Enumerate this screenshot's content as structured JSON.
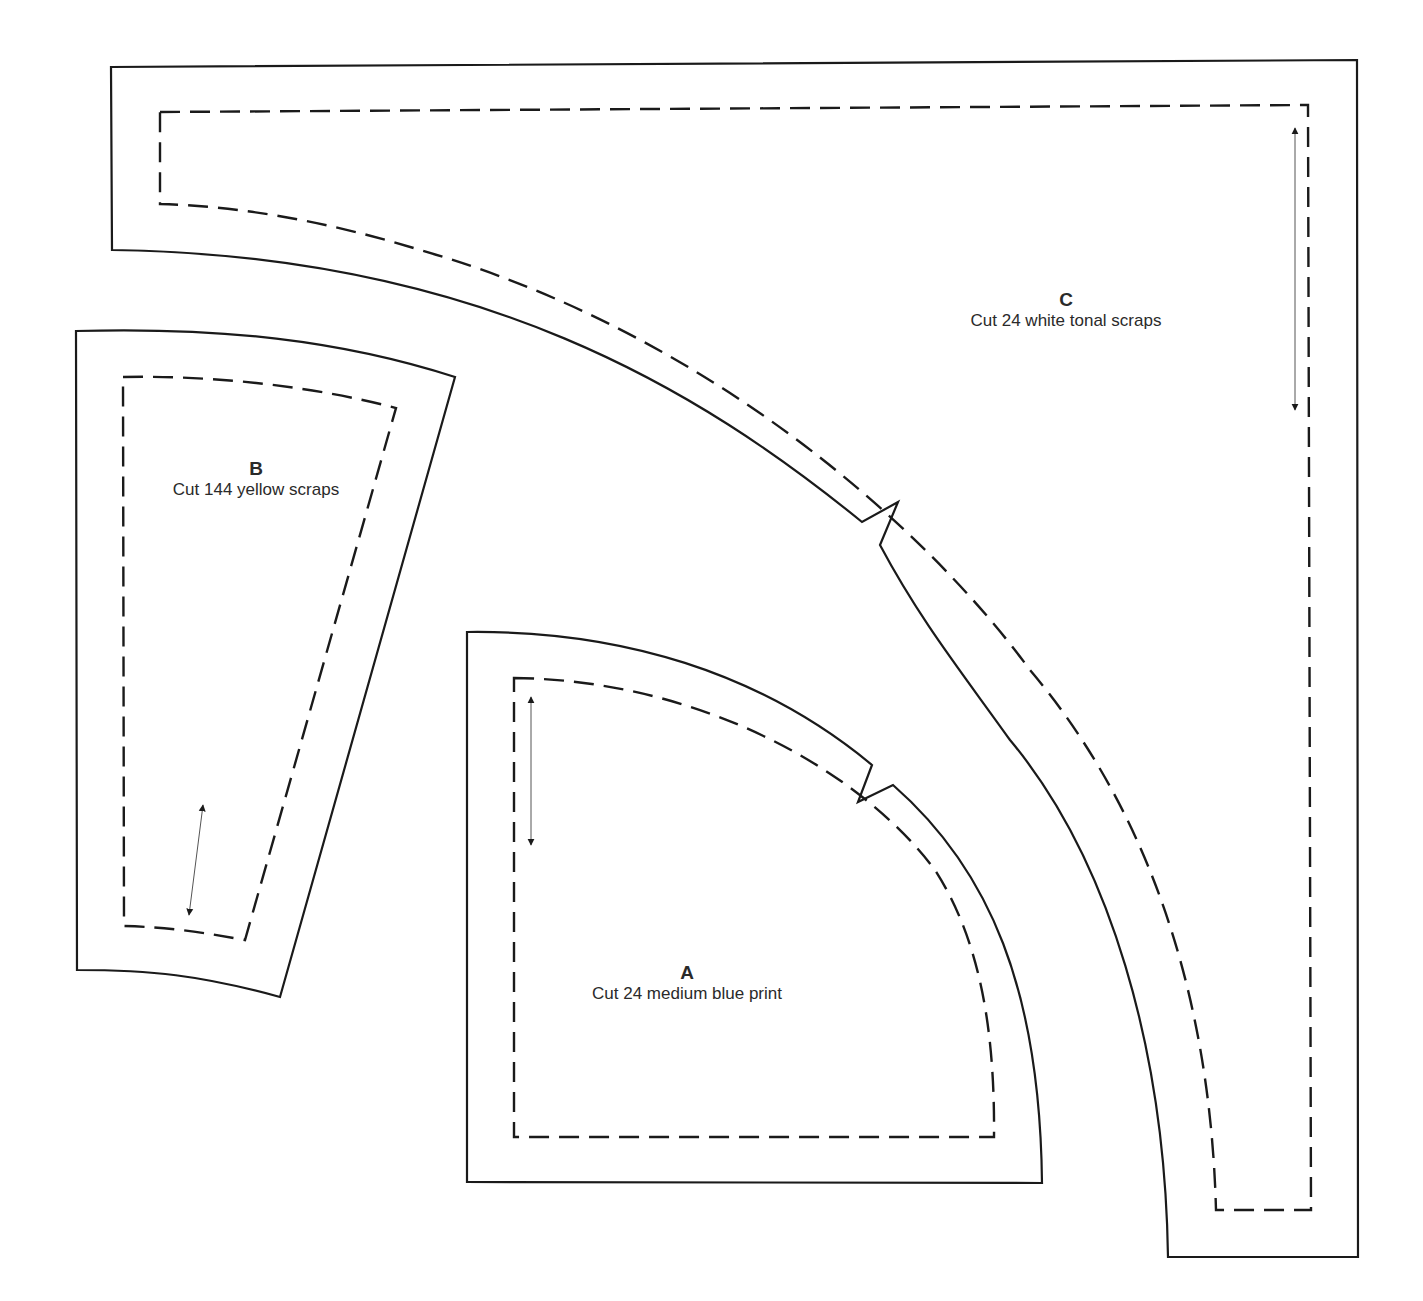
{
  "pieces": [
    {
      "id": "A",
      "letter": "A",
      "instruction": "Cut 24 medium blue print"
    },
    {
      "id": "B",
      "letter": "B",
      "instruction": "Cut 144 yellow scraps"
    },
    {
      "id": "C",
      "letter": "C",
      "instruction": "Cut 24 white tonal scraps"
    }
  ],
  "colors": {
    "line": "#1a1a1a",
    "text": "#2a2a2a",
    "background": "#ffffff"
  }
}
